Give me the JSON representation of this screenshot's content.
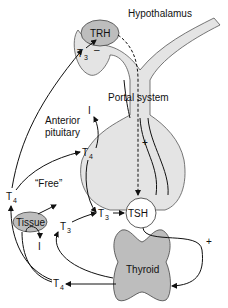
{
  "diagram": {
    "labels": {
      "hypothalamus": "Hypothalamus",
      "trh": "TRH",
      "portal_system": "Portal system",
      "anterior_pituitary_line1": "Anterior",
      "anterior_pituitary_line2": "pituitary",
      "tsh": "TSH",
      "free": "“Free”",
      "tissue": "Tissue",
      "thyroid": "Thyroid",
      "t": "T",
      "sub3": "3",
      "sub4": "4",
      "iodide": "I",
      "plus": "+",
      "minus": "–"
    }
  }
}
